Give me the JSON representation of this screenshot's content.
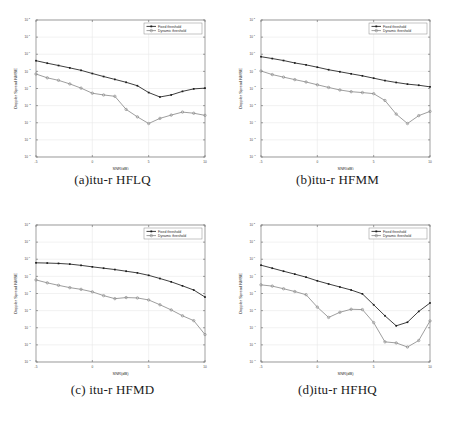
{
  "figure": {
    "panels": [
      {
        "id": "a",
        "caption": "(a)itu-r HFLQ"
      },
      {
        "id": "b",
        "caption": "(b)itu-r HFMM"
      },
      {
        "id": "c",
        "caption": "(c) itu-r HFMD"
      },
      {
        "id": "d",
        "caption": "(d)itu-r HFHQ"
      }
    ],
    "shared": {
      "xlabel": "SNR(dB)",
      "ylabel": "Doppler Spread NMSE",
      "xticklabels": [
        "-5",
        "0",
        "5",
        "10"
      ],
      "yticklabels": [
        "10",
        "10",
        "10",
        "10",
        "10",
        "10",
        "10",
        "10",
        "10"
      ],
      "ytickexps": [
        "2",
        "1",
        "0",
        "-1",
        "-2",
        "-3",
        "-4",
        "-5",
        "-6"
      ],
      "legend": [
        "Fixed threshold",
        "Dynamic threshold"
      ],
      "colors": {
        "fixed": "#1c1c1c",
        "dynamic": "#8d8d8d",
        "grid": "#e9e9e9",
        "axis": "#7a7a7a"
      }
    }
  },
  "chart_data": [
    {
      "type": "line",
      "panel": "a",
      "title": "(a)itu-r HFLQ",
      "xlabel": "SNR(dB)",
      "ylabel": "Doppler Spread NMSE",
      "xlim": [
        -5,
        10
      ],
      "ylim": [
        1e-06,
        100
      ],
      "yscale": "log",
      "grid": true,
      "legend_position": "upper right",
      "xticks": [
        -5,
        0,
        5,
        10
      ],
      "yticks": [
        100,
        10,
        1,
        0.1,
        0.01,
        0.001,
        0.0001,
        1e-05,
        1e-06
      ],
      "x": [
        -5,
        -4,
        -3,
        -2,
        -1,
        0,
        1,
        2,
        3,
        4,
        5,
        6,
        7,
        8,
        9,
        10
      ],
      "series": [
        {
          "name": "Fixed threshold",
          "values": [
            0.42,
            0.3,
            0.22,
            0.16,
            0.115,
            0.075,
            0.05,
            0.034,
            0.023,
            0.0145,
            0.0058,
            0.0032,
            0.0042,
            0.0068,
            0.0095,
            0.0105
          ]
        },
        {
          "name": "Dynamic threshold",
          "values": [
            0.07,
            0.042,
            0.03,
            0.0185,
            0.0105,
            0.0053,
            0.0042,
            0.0035,
            0.0006,
            0.00022,
            9e-05,
            0.00018,
            0.00028,
            0.00042,
            0.00036,
            0.00027
          ]
        }
      ]
    },
    {
      "type": "line",
      "panel": "b",
      "title": "(b)itu-r HFMM",
      "xlabel": "SNR(dB)",
      "ylabel": "Doppler Spread NMSE",
      "xlim": [
        -5,
        10
      ],
      "ylim": [
        1e-06,
        100
      ],
      "yscale": "log",
      "grid": true,
      "legend_position": "upper right",
      "xticks": [
        -5,
        0,
        5,
        10
      ],
      "yticks": [
        100,
        10,
        1,
        0.1,
        0.01,
        0.001,
        0.0001,
        1e-05,
        1e-06
      ],
      "x": [
        -5,
        -4,
        -3,
        -2,
        -1,
        0,
        1,
        2,
        3,
        4,
        5,
        6,
        7,
        8,
        9,
        10
      ],
      "series": [
        {
          "name": "Fixed threshold",
          "values": [
            0.72,
            0.56,
            0.43,
            0.31,
            0.24,
            0.175,
            0.125,
            0.095,
            0.072,
            0.055,
            0.04,
            0.029,
            0.0225,
            0.018,
            0.0155,
            0.0125
          ]
        },
        {
          "name": "Dynamic threshold",
          "values": [
            0.105,
            0.065,
            0.046,
            0.033,
            0.024,
            0.0165,
            0.0115,
            0.0082,
            0.0065,
            0.0058,
            0.005,
            0.002,
            0.00032,
            9e-05,
            0.00026,
            0.00046
          ]
        }
      ]
    },
    {
      "type": "line",
      "panel": "c",
      "title": "(c) itu-r HFMD",
      "xlabel": "SNR(dB)",
      "ylabel": "Doppler Spread NMSE",
      "xlim": [
        -5,
        10
      ],
      "ylim": [
        1e-06,
        100
      ],
      "yscale": "log",
      "grid": true,
      "legend_position": "upper right",
      "xticks": [
        -5,
        0,
        5,
        10
      ],
      "yticks": [
        100,
        10,
        1,
        0.1,
        0.01,
        0.001,
        0.0001,
        1e-05,
        1e-06
      ],
      "x": [
        -5,
        -4,
        -3,
        -2,
        -1,
        0,
        1,
        2,
        3,
        4,
        5,
        6,
        7,
        8,
        9,
        10
      ],
      "series": [
        {
          "name": "Fixed threshold",
          "values": [
            0.62,
            0.6,
            0.57,
            0.52,
            0.44,
            0.36,
            0.3,
            0.25,
            0.2,
            0.16,
            0.115,
            0.075,
            0.048,
            0.028,
            0.016,
            0.0062
          ]
        },
        {
          "name": "Dynamic threshold",
          "values": [
            0.062,
            0.042,
            0.03,
            0.022,
            0.0175,
            0.0125,
            0.0075,
            0.005,
            0.0058,
            0.0055,
            0.0042,
            0.0022,
            0.0011,
            0.0005,
            0.00026,
            4e-05
          ]
        }
      ]
    },
    {
      "type": "line",
      "panel": "d",
      "title": "(d)itu-r HFHQ",
      "xlabel": "SNR(dB)",
      "ylabel": "Doppler Spread NMSE",
      "xlim": [
        -5,
        10
      ],
      "ylim": [
        1e-06,
        100
      ],
      "yscale": "log",
      "grid": true,
      "legend_position": "upper right",
      "xticks": [
        -5,
        0,
        5,
        10
      ],
      "yticks": [
        100,
        10,
        1,
        0.1,
        0.01,
        0.001,
        0.0001,
        1e-05,
        1e-06
      ],
      "x": [
        -5,
        -4,
        -3,
        -2,
        -1,
        0,
        1,
        2,
        3,
        4,
        5,
        6,
        7,
        8,
        9,
        10
      ],
      "series": [
        {
          "name": "Fixed threshold",
          "values": [
            0.45,
            0.3,
            0.2,
            0.135,
            0.09,
            0.055,
            0.036,
            0.024,
            0.016,
            0.0095,
            0.0022,
            0.0005,
            0.00013,
            0.00021,
            0.0009,
            0.0028
          ]
        },
        {
          "name": "Dynamic threshold",
          "values": [
            0.032,
            0.027,
            0.019,
            0.013,
            0.0085,
            0.0016,
            0.0004,
            0.0008,
            0.0012,
            0.00115,
            0.0002,
            1.5e-05,
            1.3e-05,
            7.5e-06,
            1.8e-05,
            0.00025
          ]
        }
      ]
    }
  ]
}
